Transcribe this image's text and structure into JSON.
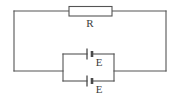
{
  "figure": {
    "background_color": "#ffffff",
    "line_color": "#545454",
    "text_color": "#3d3d3d",
    "width": 178,
    "height": 108
  },
  "components": {
    "resistor": {
      "label": "R",
      "symbol": "resistor-rectangle",
      "label_x": 90,
      "label_y": 24
    },
    "cell_top": {
      "label": "E",
      "symbol": "battery-cell",
      "label_x": 99,
      "label_y": 63
    },
    "cell_bottom": {
      "label": "E",
      "symbol": "battery-cell",
      "label_x": 99,
      "label_y": 90
    }
  },
  "geometry": {
    "outer_loop": {
      "left": 14,
      "top": 11,
      "right": 166,
      "bottom": 71
    },
    "resistor_box": {
      "left": 69,
      "top": 7,
      "right": 112,
      "bottom": 16
    },
    "battery_block": {
      "left": 63,
      "right": 114,
      "top_branch_y": 54,
      "bottom_branch_y": 81
    },
    "cell_x": 90
  }
}
